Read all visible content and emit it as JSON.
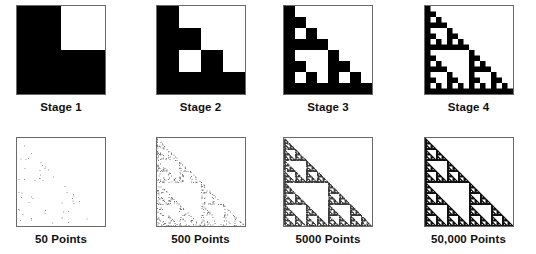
{
  "figure": {
    "background_color": "#ffffff",
    "ink_color": "#000000",
    "panel_border_color": "#6a6a6a"
  },
  "chart_data": {
    "type": "heatmap",
    "xlabel": "",
    "ylabel": "",
    "grid": false,
    "legend_position": "none",
    "recursion_rule": {
      "grid": 2,
      "filled_quadrants": [
        [
          0,
          0
        ],
        [
          1,
          0
        ],
        [
          1,
          1
        ]
      ],
      "removed_quadrants": [
        [
          0,
          1
        ]
      ],
      "note": "quadrant coordinates are [row, col] with row 0 = top, col 0 = left; filled quadrants recurse, removed quadrant stays white"
    },
    "panels": [
      {
        "row": "stages",
        "index": 0,
        "label": "Stage 1",
        "grid_size": 2,
        "black_cells": 3,
        "white_cells": 1,
        "iteration": 1
      },
      {
        "row": "stages",
        "index": 1,
        "label": "Stage 2",
        "grid_size": 4,
        "black_cells": 9,
        "white_cells": 7,
        "iteration": 2
      },
      {
        "row": "stages",
        "index": 2,
        "label": "Stage 3",
        "grid_size": 8,
        "black_cells": 27,
        "white_cells": 37,
        "iteration": 3
      },
      {
        "row": "stages",
        "index": 3,
        "label": "Stage 4",
        "grid_size": 16,
        "black_cells": 81,
        "white_cells": 175,
        "iteration": 4
      },
      {
        "row": "points",
        "index": 0,
        "label": "50 Points",
        "point_count": 50,
        "dot_color": "#9a9a9a"
      },
      {
        "row": "points",
        "index": 1,
        "label": "500 Points",
        "point_count": 500,
        "dot_color": "#7d7d7d"
      },
      {
        "row": "points",
        "index": 2,
        "label": "5000 Points",
        "point_count": 5000,
        "dot_color": "#3c3c3c"
      },
      {
        "row": "points",
        "index": 3,
        "label": "50,000 Points",
        "point_count": 50000,
        "dot_color": "#111111"
      }
    ]
  },
  "stages_row": {
    "name": "deterministic-stages",
    "panels": [
      {
        "label": "Stage 1",
        "grid_size": 2,
        "iteration": 1
      },
      {
        "label": "Stage 2",
        "grid_size": 4,
        "iteration": 2
      },
      {
        "label": "Stage 3",
        "grid_size": 8,
        "iteration": 3
      },
      {
        "label": "Stage 4",
        "grid_size": 16,
        "iteration": 4
      }
    ]
  },
  "points_row": {
    "name": "chaos-game-point-sets",
    "panels": [
      {
        "label": "50 Points",
        "point_count": 50,
        "dot_color": "#9a9a9a",
        "dot_size": 1
      },
      {
        "label": "500 Points",
        "point_count": 500,
        "dot_color": "#7d7d7d",
        "dot_size": 1
      },
      {
        "label": "5000 Points",
        "point_count": 5000,
        "dot_color": "#3c3c3c",
        "dot_size": 1
      },
      {
        "label": "50,000 Points",
        "point_count": 50000,
        "dot_color": "#111111",
        "dot_size": 1
      }
    ]
  }
}
